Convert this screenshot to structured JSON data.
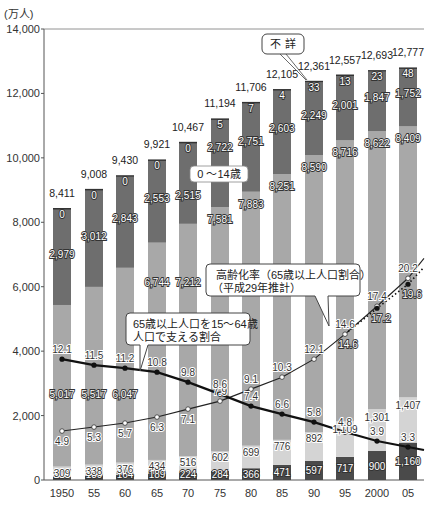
{
  "chart_data": {
    "type": "bar",
    "subtype": "stacked bar with line overlays",
    "unit_label": "(万人)",
    "ylim": [
      0,
      14000
    ],
    "yticks": [
      "0",
      "2,000",
      "4,000",
      "6,000",
      "8,000",
      "10,000",
      "12,000",
      "14,000"
    ],
    "categories": [
      "1950",
      "55",
      "60",
      "65",
      "70",
      "75",
      "80",
      "85",
      "90",
      "95",
      "2000",
      "05"
    ],
    "totals": [
      "8,411",
      "9,008",
      "9,430",
      "9,921",
      "10,467",
      "11,194",
      "11,706",
      "12,105",
      "12,361",
      "12,557",
      "12,693",
      "12,777"
    ],
    "series": [
      {
        "name": "75歳以上",
        "color": "#4a4a4a",
        "values": [
          107,
          139,
          164,
          189,
          224,
          284,
          366,
          471,
          597,
          717,
          900,
          1160
        ]
      },
      {
        "name": "65〜74歳",
        "color": "#d4d4d4",
        "values": [
          309,
          338,
          376,
          434,
          516,
          602,
          699,
          776,
          892,
          1109,
          1301,
          1407
        ]
      },
      {
        "name": "15〜64歳",
        "color": "#a8a8a8",
        "values": [
          5017,
          5517,
          6047,
          6744,
          7212,
          7581,
          7883,
          8251,
          8590,
          8716,
          8622,
          8409
        ]
      },
      {
        "name": "0〜14歳",
        "color": "#6e6e6e",
        "values": [
          2979,
          3012,
          2843,
          2553,
          2515,
          2722,
          2751,
          2603,
          2249,
          2001,
          1847,
          1752
        ]
      },
      {
        "name": "不詳",
        "color": "#6e6e6e",
        "values": [
          0,
          0,
          0,
          0,
          0,
          5,
          7,
          4,
          33,
          13,
          23,
          48
        ]
      }
    ],
    "lines": [
      {
        "name": "高齢化率（65歳以上人口割合）",
        "marker": "white-circle",
        "values": [
          4.9,
          5.3,
          5.7,
          6.3,
          7.1,
          7.9,
          9.1,
          10.3,
          12.1,
          14.6,
          17.4,
          20.2
        ]
      },
      {
        "name": "高齢化率（平成29年推計）",
        "marker": "black-circle-dotted",
        "values": [
          null,
          null,
          null,
          null,
          null,
          null,
          null,
          null,
          null,
          14.6,
          17.2,
          19.6
        ]
      },
      {
        "name": "65歳以上人口を15〜64歳人口で支える割合",
        "marker": "black-circle",
        "values": [
          12.1,
          11.5,
          11.2,
          10.8,
          9.8,
          8.6,
          7.4,
          6.6,
          5.8,
          4.8,
          3.9,
          3.3
        ]
      }
    ],
    "annotations": [
      "不 詳",
      "0 〜14歳",
      "高齢化率（65歳以上人口割合）",
      "（平成29年推計）",
      "65歳以上人口を15〜64歳",
      "人口で支える割合"
    ],
    "grid": false,
    "legend": "callouts"
  },
  "labels": {
    "unit": "(万人)",
    "callout_unknown": "不 詳",
    "callout_child": "0 〜14歳",
    "callout_aging_1": "高齢化率（65歳以上人口割合）",
    "callout_aging_2": "（平成29年推計）",
    "callout_support_1": "65歳以上人口を15〜64歳",
    "callout_support_2": "人口で支える割合"
  }
}
